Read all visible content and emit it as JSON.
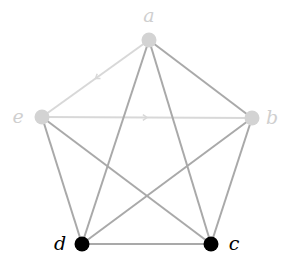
{
  "diagram": {
    "type": "graph",
    "colors": {
      "faded_node": "#d3d3d3",
      "active_node": "#000000",
      "faded_edge": "#d8d8d8",
      "normal_edge": "#a9a9a9",
      "faded_label": "#cfcfcf",
      "active_label": "#000000"
    },
    "nodes": [
      {
        "id": "a",
        "label": "a",
        "x": 149,
        "y": 40,
        "state": "faded",
        "label_x": 149,
        "label_y": 22
      },
      {
        "id": "b",
        "label": "b",
        "x": 252,
        "y": 118,
        "state": "faded",
        "label_x": 272,
        "label_y": 124
      },
      {
        "id": "c",
        "label": "c",
        "x": 211,
        "y": 244,
        "state": "active",
        "label_x": 234,
        "label_y": 250
      },
      {
        "id": "d",
        "label": "d",
        "x": 82,
        "y": 244,
        "state": "active",
        "label_x": 60,
        "label_y": 250
      },
      {
        "id": "e",
        "label": "e",
        "x": 42,
        "y": 117,
        "state": "faded",
        "label_x": 18,
        "label_y": 123
      }
    ],
    "edges": [
      {
        "from": "a",
        "to": "e",
        "style": "faded",
        "directed": true
      },
      {
        "from": "e",
        "to": "b",
        "style": "faded",
        "directed": true
      },
      {
        "from": "a",
        "to": "b",
        "style": "normal",
        "directed": false
      },
      {
        "from": "a",
        "to": "c",
        "style": "normal",
        "directed": false
      },
      {
        "from": "a",
        "to": "d",
        "style": "normal",
        "directed": false
      },
      {
        "from": "b",
        "to": "c",
        "style": "normal",
        "directed": false
      },
      {
        "from": "b",
        "to": "d",
        "style": "normal",
        "directed": false
      },
      {
        "from": "c",
        "to": "d",
        "style": "normal",
        "directed": false
      },
      {
        "from": "e",
        "to": "c",
        "style": "normal",
        "directed": false
      },
      {
        "from": "e",
        "to": "d",
        "style": "normal",
        "directed": false
      }
    ]
  }
}
